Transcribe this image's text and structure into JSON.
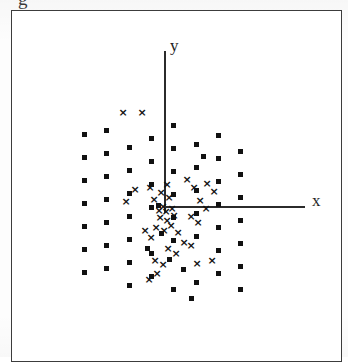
{
  "figure": {
    "caption_partial": "g",
    "width": 348,
    "height": 357,
    "background_color": "#ffffff",
    "frame": {
      "left": 11,
      "top": 10,
      "width": 331,
      "height": 352,
      "border_color": "#3c3c3c",
      "border_width": 1.5
    }
  },
  "axes": {
    "origin": {
      "x": 163,
      "y": 205
    },
    "x_axis": {
      "label": "x",
      "label_x": 311,
      "label_y": 191,
      "label_font_size": 17,
      "line_start_x": 163,
      "line_end_x": 304,
      "line_y": 205,
      "line_thickness": 1.6,
      "color": "#2b2b2b"
    },
    "y_axis": {
      "label": "y",
      "label_x": 169,
      "label_y": 36,
      "label_font_size": 17,
      "line_top_y": 50,
      "line_bottom_y": 212,
      "line_x": 163,
      "line_thickness": 1.6,
      "color": "#2b2b2b"
    }
  },
  "chart_data": {
    "type": "scatter",
    "title": "",
    "xlabel": "x",
    "ylabel": "y",
    "grid": false,
    "legend_position": "none",
    "axis_style": "centered-cross",
    "marker_colors": {
      "square": "#111111",
      "cross": "#111111"
    },
    "xlim": [
      -3.6,
      6.4
    ],
    "ylim": [
      -3.7,
      4.3
    ],
    "units": "pixels-as-plotted",
    "series": [
      {
        "name": "square",
        "marker": "filled-square",
        "count": 61,
        "points": [
          [
            83,
            133
          ],
          [
            83,
            156
          ],
          [
            83,
            179
          ],
          [
            83,
            202
          ],
          [
            83,
            225
          ],
          [
            83,
            248
          ],
          [
            83,
            271
          ],
          [
            105,
            129
          ],
          [
            105,
            152
          ],
          [
            105,
            175
          ],
          [
            105,
            198
          ],
          [
            105,
            221
          ],
          [
            105,
            244
          ],
          [
            105,
            267
          ],
          [
            128,
            146
          ],
          [
            128,
            169
          ],
          [
            128,
            192
          ],
          [
            128,
            215
          ],
          [
            128,
            238
          ],
          [
            128,
            261
          ],
          [
            128,
            284
          ],
          [
            150,
            137
          ],
          [
            150,
            160
          ],
          [
            150,
            183
          ],
          [
            150,
            206
          ],
          [
            150,
            252
          ],
          [
            150,
            275
          ],
          [
            157,
            204
          ],
          [
            172,
            124
          ],
          [
            172,
            147
          ],
          [
            172,
            170
          ],
          [
            172,
            193
          ],
          [
            172,
            216
          ],
          [
            172,
            239
          ],
          [
            172,
            288
          ],
          [
            195,
            143
          ],
          [
            195,
            166
          ],
          [
            195,
            189
          ],
          [
            195,
            212
          ],
          [
            195,
            235
          ],
          [
            195,
            281
          ],
          [
            202,
            155
          ],
          [
            217,
            134
          ],
          [
            217,
            157
          ],
          [
            217,
            180
          ],
          [
            217,
            203
          ],
          [
            217,
            226
          ],
          [
            217,
            249
          ],
          [
            217,
            272
          ],
          [
            239,
            150
          ],
          [
            239,
            173
          ],
          [
            239,
            196
          ],
          [
            239,
            219
          ],
          [
            239,
            242
          ],
          [
            239,
            265
          ],
          [
            239,
            288
          ],
          [
            182,
            268
          ],
          [
            160,
            232
          ],
          [
            146,
            247
          ],
          [
            168,
            258
          ],
          [
            190,
            297
          ]
        ]
      },
      {
        "name": "cross",
        "marker": "x-cross",
        "count": 40,
        "points": [
          [
            122,
            111
          ],
          [
            141,
            111
          ],
          [
            134,
            188
          ],
          [
            149,
            186
          ],
          [
            153,
            198
          ],
          [
            160,
            191
          ],
          [
            166,
            183
          ],
          [
            168,
            196
          ],
          [
            162,
            205
          ],
          [
            158,
            209
          ],
          [
            165,
            210
          ],
          [
            171,
            207
          ],
          [
            159,
            216
          ],
          [
            166,
            219
          ],
          [
            173,
            214
          ],
          [
            155,
            226
          ],
          [
            163,
            229
          ],
          [
            170,
            224
          ],
          [
            177,
            231
          ],
          [
            150,
            236
          ],
          [
            144,
            229
          ],
          [
            186,
            178
          ],
          [
            193,
            186
          ],
          [
            206,
            182
          ],
          [
            213,
            190
          ],
          [
            199,
            199
          ],
          [
            205,
            207
          ],
          [
            190,
            215
          ],
          [
            197,
            221
          ],
          [
            183,
            241
          ],
          [
            190,
            244
          ],
          [
            167,
            247
          ],
          [
            175,
            252
          ],
          [
            154,
            259
          ],
          [
            162,
            263
          ],
          [
            148,
            278
          ],
          [
            156,
            272
          ],
          [
            196,
            262
          ],
          [
            211,
            259
          ],
          [
            125,
            200
          ]
        ]
      }
    ]
  }
}
